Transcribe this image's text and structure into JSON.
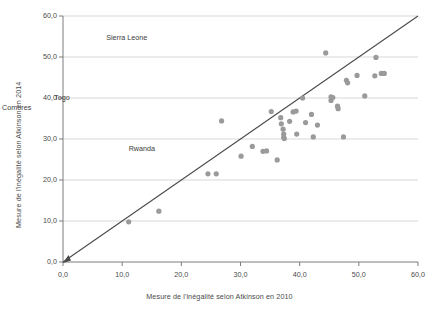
{
  "chart_data": {
    "type": "scatter",
    "title": "",
    "xlabel": "Mesure de l'inégalité selon Atkinson en 2010",
    "ylabel": "Mesure de l'inégalité selon Atkinson en 2014",
    "xlim": [
      0,
      60
    ],
    "ylim": [
      0,
      60
    ],
    "xticks": [
      "0,0",
      "10,0",
      "20,0",
      "30,0",
      "40,0",
      "50,0",
      "60,0"
    ],
    "xtick_values": [
      0,
      10,
      20,
      30,
      40,
      50,
      60
    ],
    "yticks": [
      "0,0",
      "10,0",
      "20,0",
      "30,0",
      "40,0",
      "50,0",
      "60,0"
    ],
    "ytick_values": [
      0,
      10,
      20,
      30,
      40,
      50,
      60
    ],
    "grid": "horizontal",
    "legend": "none",
    "point_color": "#9a9a9a",
    "line_color": "#4a4a4a",
    "reference_line": {
      "name": "ligne 45 degres",
      "from": [
        0,
        0
      ],
      "to": [
        60,
        60
      ],
      "arrow_at": [
        0,
        0
      ]
    },
    "series": [
      {
        "name": "Pays",
        "points": [
          [
            11.1,
            9.8
          ],
          [
            16.2,
            12.4
          ],
          [
            24.5,
            21.5
          ],
          [
            25.9,
            21.5
          ],
          [
            26.8,
            34.4
          ],
          [
            30.1,
            25.8
          ],
          [
            32.0,
            28.2
          ],
          [
            33.8,
            27.0
          ],
          [
            34.4,
            27.1
          ],
          [
            35.2,
            36.7
          ],
          [
            36.2,
            24.9
          ],
          [
            36.8,
            35.2
          ],
          [
            36.9,
            33.7
          ],
          [
            37.2,
            32.4
          ],
          [
            37.3,
            31.2
          ],
          [
            37.3,
            30.4
          ],
          [
            37.4,
            30.1
          ],
          [
            38.3,
            34.3
          ],
          [
            38.9,
            36.6
          ],
          [
            39.4,
            36.8
          ],
          [
            39.5,
            31.2
          ],
          [
            40.5,
            40.0
          ],
          [
            41.0,
            34.0
          ],
          [
            42.0,
            36.0
          ],
          [
            42.3,
            30.5
          ],
          [
            43.0,
            33.4
          ],
          [
            44.4,
            51.0
          ],
          [
            45.3,
            40.3
          ],
          [
            45.3,
            39.4
          ],
          [
            45.6,
            40.1
          ],
          [
            46.4,
            38.0
          ],
          [
            46.5,
            37.4
          ],
          [
            47.4,
            30.5
          ],
          [
            47.9,
            44.3
          ],
          [
            48.1,
            43.7
          ],
          [
            49.7,
            45.5
          ],
          [
            51.0,
            40.5
          ],
          [
            52.7,
            45.4
          ],
          [
            52.9,
            49.9
          ],
          [
            53.8,
            46.0
          ],
          [
            54.3,
            46.0
          ]
        ]
      }
    ],
    "annotations": [
      {
        "label": "Sierra Leone",
        "x": 44.4,
        "y": 51.0,
        "label_x": 44.4,
        "label_y": 54.6
      },
      {
        "label": "Comores",
        "x": 26.8,
        "y": 34.4,
        "label_x": 26.8,
        "label_y": 37.6
      },
      {
        "label": "Togo",
        "x": 35.2,
        "y": 36.7,
        "label_x": 35.6,
        "label_y": 40.0
      },
      {
        "label": "Rwanda",
        "x": 47.4,
        "y": 30.5,
        "label_x": 48.2,
        "label_y": 27.6
      }
    ]
  }
}
